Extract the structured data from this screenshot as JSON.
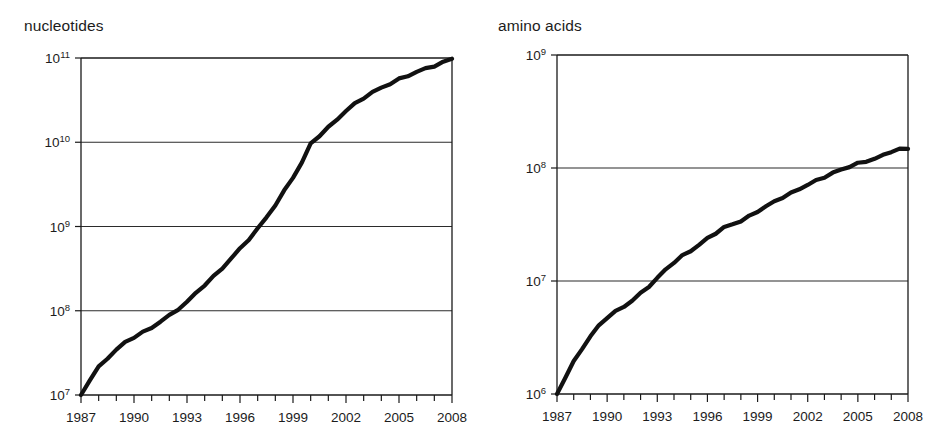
{
  "figure": {
    "background_color": "#ffffff",
    "line_color": "#111111",
    "axis_color": "#1a1a1a",
    "panels": [
      "nucleotides",
      "amino acids"
    ]
  },
  "panels": {
    "left": {
      "title": "nucleotides",
      "y_tick_labels": [
        "10¹¹",
        "10¹⁰",
        "10⁹",
        "10⁸",
        "10⁷"
      ],
      "y_tick_bases": [
        "10",
        "10",
        "10",
        "10",
        "10"
      ],
      "y_tick_exponents": [
        "11",
        "10",
        "9",
        "8",
        "7"
      ],
      "x_tick_labels": [
        "1987",
        "1990",
        "1993",
        "1996",
        "1999",
        "2002",
        "2005",
        "2008"
      ]
    },
    "right": {
      "title": "amino acids",
      "y_tick_labels": [
        "10⁹",
        "10⁸",
        "10⁷",
        "10⁶"
      ],
      "y_tick_bases": [
        "10",
        "10",
        "10",
        "10"
      ],
      "y_tick_exponents": [
        "9",
        "8",
        "7",
        "6"
      ],
      "x_tick_labels": [
        "1987",
        "1990",
        "1993",
        "1996",
        "1999",
        "2002",
        "2005",
        "2008"
      ]
    }
  },
  "chart_data": [
    {
      "type": "line",
      "title": "nucleotides",
      "xlabel": "",
      "ylabel": "nucleotides",
      "yscale": "log",
      "xlim": [
        1987,
        2008
      ],
      "ylim": [
        10000000,
        100000000000
      ],
      "grid": true,
      "legend": "none",
      "x_major_ticks": [
        1987,
        1990,
        1993,
        1996,
        1999,
        2002,
        2005,
        2008
      ],
      "x_minor_ticks": [
        1988,
        1989,
        1991,
        1992,
        1994,
        1995,
        1997,
        1998,
        2000,
        2001,
        2003,
        2004,
        2006,
        2007
      ],
      "y_ticks": [
        10000000,
        100000000,
        1000000000,
        10000000000,
        100000000000
      ],
      "series": [
        {
          "name": "GenBank nucleotide bases",
          "x": [
            1987.0,
            1987.5,
            1988.0,
            1988.5,
            1989.0,
            1989.5,
            1990.0,
            1990.5,
            1991.0,
            1991.5,
            1992.0,
            1992.5,
            1993.0,
            1993.5,
            1994.0,
            1994.5,
            1995.0,
            1995.5,
            1996.0,
            1996.5,
            1997.0,
            1997.5,
            1998.0,
            1998.5,
            1999.0,
            1999.5,
            2000.0,
            2000.5,
            2001.0,
            2001.5,
            2002.0,
            2002.5,
            2003.0,
            2003.5,
            2004.0,
            2004.5,
            2005.0,
            2005.5,
            2006.0,
            2006.5,
            2007.0,
            2007.5,
            2008.0
          ],
          "y": [
            10000000.0,
            15000000.0,
            21000000.0,
            27000000.0,
            34000000.0,
            42000000.0,
            49000000.0,
            56000000.0,
            64000000.0,
            76000000.0,
            88000000.0,
            105000000.0,
            125000000.0,
            160000000.0,
            200000000.0,
            250000000.0,
            320000000.0,
            420000000.0,
            550000000.0,
            720000000.0,
            950000000.0,
            1300000000.0,
            1800000000.0,
            2600000000.0,
            3800000000.0,
            5600000000.0,
            9500000000.0,
            12000000000.0,
            15000000000.0,
            19000000000.0,
            24000000000.0,
            29000000000.0,
            34000000000.0,
            39000000000.0,
            44000000000.0,
            49000000000.0,
            55000000000.0,
            61000000000.0,
            68000000000.0,
            75000000000.0,
            82000000000.0,
            90000000000.0,
            100000000000.0
          ]
        }
      ]
    },
    {
      "type": "line",
      "title": "amino acids",
      "xlabel": "",
      "ylabel": "amino acids",
      "yscale": "log",
      "xlim": [
        1987,
        2008
      ],
      "ylim": [
        1000000,
        1000000000
      ],
      "grid": true,
      "legend": "none",
      "x_major_ticks": [
        1987,
        1990,
        1993,
        1996,
        1999,
        2002,
        2005,
        2008
      ],
      "x_minor_ticks": [
        1988,
        1989,
        1991,
        1992,
        1994,
        1995,
        1997,
        1998,
        2000,
        2001,
        2003,
        2004,
        2006,
        2007
      ],
      "y_ticks": [
        1000000,
        10000000,
        100000000,
        1000000000
      ],
      "series": [
        {
          "name": "GenBank amino acid residues",
          "x": [
            1987.0,
            1987.5,
            1988.0,
            1988.5,
            1989.0,
            1989.5,
            1990.0,
            1990.5,
            1991.0,
            1991.5,
            1992.0,
            1992.5,
            1993.0,
            1993.5,
            1994.0,
            1994.5,
            1995.0,
            1995.5,
            1996.0,
            1996.5,
            1997.0,
            1997.5,
            1998.0,
            1998.5,
            1999.0,
            1999.5,
            2000.0,
            2000.5,
            2001.0,
            2001.5,
            2002.0,
            2002.5,
            2003.0,
            2003.5,
            2004.0,
            2004.5,
            2005.0,
            2005.5,
            2006.0,
            2006.5,
            2007.0,
            2007.5,
            2008.0
          ],
          "y": [
            1000000.0,
            1400000.0,
            1900000.0,
            2500000.0,
            3200000.0,
            4000000.0,
            4800000.0,
            5400000.0,
            6000000.0,
            6800000.0,
            7800000.0,
            9000000.0,
            10500000.0,
            12500000.0,
            14500000.0,
            16500000.0,
            18500000.0,
            21000000.0,
            24000000.0,
            27000000.0,
            30000000.0,
            32000000.0,
            34000000.0,
            37000000.0,
            41000000.0,
            45000000.0,
            50000000.0,
            55000000.0,
            60000000.0,
            66000000.0,
            72000000.0,
            78000000.0,
            84000000.0,
            90000000.0,
            96000000.0,
            102000000.0,
            108000000.0,
            114000000.0,
            120000000.0,
            130000000.0,
            142000000.0,
            148000000.0,
            150000000.0
          ]
        }
      ]
    }
  ]
}
